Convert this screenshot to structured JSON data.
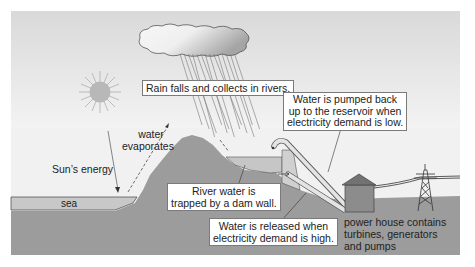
{
  "diagram": {
    "topic": "Pumped-storage hydroelectric scheme",
    "labels": {
      "rain": "Rain falls and collects in rivers.",
      "pumped_line1": "Water is pumped back",
      "pumped_line2": "up to the reservoir when",
      "pumped_line3": "electricity demand is low.",
      "water_line1": "water",
      "water_line2": "evaporates",
      "sun_energy": "Sun’s energy",
      "sea": "sea",
      "river_line1": "River water is",
      "river_line2": "trapped by a dam wall.",
      "released_line1": "Water is released when",
      "released_line2": "electricity demand is high.",
      "powerhouse_line1": "power house contains",
      "powerhouse_line2": "turbines, generators",
      "powerhouse_line3": "and pumps"
    },
    "colors": {
      "sky_top": "#dcdcdc",
      "sky_bottom": "#f2f2f2",
      "land": "#9a9a9a",
      "water": "#c4c4c4",
      "sun": "#b9b9b9",
      "cloud_light": "#f6f6f6",
      "cloud_dark": "#a8a8a8",
      "house": "#8a8a8a",
      "roof": "#6e6e6e"
    }
  }
}
